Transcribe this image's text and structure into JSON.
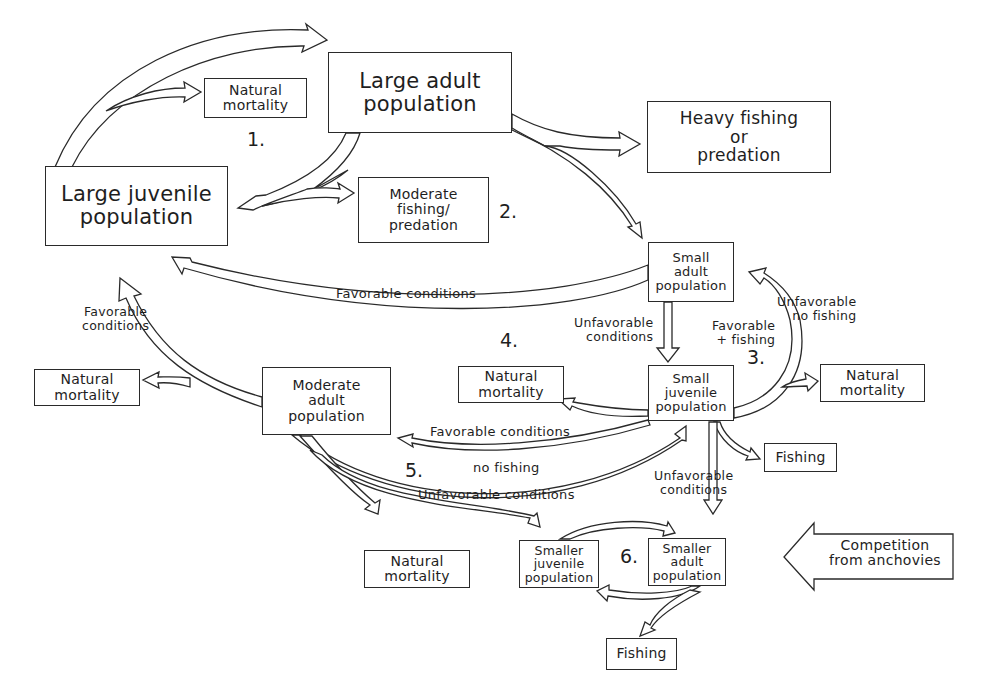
{
  "diagram": {
    "type": "population-flow-diagram",
    "nodes": {
      "large_adult": {
        "line1": "Large adult",
        "line2": "population"
      },
      "large_juvenile": {
        "line1": "Large juvenile",
        "line2": "population"
      },
      "natural_mortality_1": {
        "line1": "Natural",
        "line2": "mortality"
      },
      "heavy_fishing": {
        "line1": "Heavy fishing",
        "line2": "or",
        "line3": "predation"
      },
      "moderate_fishing": {
        "line1": "Moderate",
        "line2": "fishing/",
        "line3": "predation"
      },
      "small_adult": {
        "line1": "Small",
        "line2": "adult",
        "line3": "population"
      },
      "small_juvenile": {
        "line1": "Small",
        "line2": "juvenile",
        "line3": "population"
      },
      "natural_mortality_left": {
        "line1": "Natural",
        "line2": "mortality"
      },
      "moderate_adult": {
        "line1": "Moderate",
        "line2": "adult",
        "line3": "population"
      },
      "natural_mortality_mid": {
        "line1": "Natural",
        "line2": "mortality"
      },
      "natural_mortality_right": {
        "line1": "Natural",
        "line2": "mortality"
      },
      "fishing_right": {
        "line1": "Fishing"
      },
      "natural_mortality_bottom": {
        "line1": "Natural",
        "line2": "mortality"
      },
      "smaller_juvenile": {
        "line1": "Smaller",
        "line2": "juvenile",
        "line3": "population"
      },
      "smaller_adult": {
        "line1": "Smaller",
        "line2": "adult",
        "line3": "population"
      },
      "fishing_bottom": {
        "line1": "Fishing"
      },
      "competition": {
        "line1": "Competition",
        "line2": "from anchovies"
      }
    },
    "edge_labels": {
      "favorable_conditions_top": "Favorable conditions",
      "favorable_conditions_left_1": "Favorable",
      "favorable_conditions_left_2": "conditions",
      "unfavorable_conditions_sa_1": "Unfavorable",
      "unfavorable_conditions_sa_2": "conditions",
      "favorable_fishing_1": "Favorable",
      "favorable_fishing_2": "+ fishing",
      "unfavorable_no_fishing_1": "Unfavorable",
      "unfavorable_no_fishing_2": "no fishing",
      "favorable_conditions_mid": "Favorable conditions",
      "no_fishing": "no fishing",
      "unfavorable_conditions_low": "Unfavorable conditions",
      "unfavorable_conditions_sj_1": "Unfavorable",
      "unfavorable_conditions_sj_2": "conditions"
    },
    "scenario_numbers": [
      "1.",
      "2.",
      "3.",
      "4.",
      "5.",
      "6."
    ]
  }
}
